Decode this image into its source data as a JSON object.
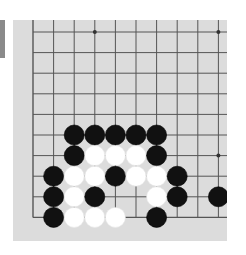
{
  "board": {
    "title": "Go board (partial view, lower-left corner)",
    "columns": 10,
    "rows": 10,
    "origin_px": {
      "x": 33,
      "y": 32
    },
    "spacing_px": 20.6,
    "edges": {
      "left": true,
      "bottom": true,
      "top": false,
      "right": false
    },
    "colors": {
      "board": "#dcdcdc",
      "line": "#555555",
      "black": "#111111",
      "white": "#ffffff",
      "tab": "#8a8a8a"
    },
    "star_points": [
      {
        "col": 3,
        "row": 0
      },
      {
        "col": 9,
        "row": 0
      },
      {
        "col": 9,
        "row": 6
      }
    ],
    "stones": [
      {
        "col": 2,
        "row": 5,
        "color": "black"
      },
      {
        "col": 3,
        "row": 5,
        "color": "black"
      },
      {
        "col": 4,
        "row": 5,
        "color": "black"
      },
      {
        "col": 5,
        "row": 5,
        "color": "black"
      },
      {
        "col": 6,
        "row": 5,
        "color": "black"
      },
      {
        "col": 2,
        "row": 6,
        "color": "black"
      },
      {
        "col": 3,
        "row": 6,
        "color": "white"
      },
      {
        "col": 4,
        "row": 6,
        "color": "white"
      },
      {
        "col": 5,
        "row": 6,
        "color": "white"
      },
      {
        "col": 6,
        "row": 6,
        "color": "black"
      },
      {
        "col": 1,
        "row": 7,
        "color": "black"
      },
      {
        "col": 2,
        "row": 7,
        "color": "white"
      },
      {
        "col": 3,
        "row": 7,
        "color": "white"
      },
      {
        "col": 4,
        "row": 7,
        "color": "black"
      },
      {
        "col": 5,
        "row": 7,
        "color": "white"
      },
      {
        "col": 6,
        "row": 7,
        "color": "white"
      },
      {
        "col": 7,
        "row": 7,
        "color": "black"
      },
      {
        "col": 1,
        "row": 8,
        "color": "black"
      },
      {
        "col": 2,
        "row": 8,
        "color": "white"
      },
      {
        "col": 3,
        "row": 8,
        "color": "black"
      },
      {
        "col": 6,
        "row": 8,
        "color": "white"
      },
      {
        "col": 7,
        "row": 8,
        "color": "black"
      },
      {
        "col": 9,
        "row": 8,
        "color": "black"
      },
      {
        "col": 1,
        "row": 9,
        "color": "black"
      },
      {
        "col": 2,
        "row": 9,
        "color": "white"
      },
      {
        "col": 3,
        "row": 9,
        "color": "white"
      },
      {
        "col": 4,
        "row": 9,
        "color": "white"
      },
      {
        "col": 6,
        "row": 9,
        "color": "black"
      }
    ]
  }
}
